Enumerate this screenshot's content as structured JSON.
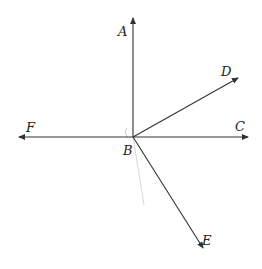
{
  "diagram": {
    "type": "rays-from-point",
    "vertex": {
      "label": "B",
      "x": 133,
      "y": 137
    },
    "rays": [
      {
        "label": "A",
        "tip": [
          133,
          16
        ]
      },
      {
        "label": "C",
        "tip": [
          250,
          137
        ]
      },
      {
        "label": "D",
        "tip": [
          240,
          77
        ]
      },
      {
        "label": "E",
        "tip": [
          204,
          250
        ]
      },
      {
        "label": "F",
        "tip": [
          17,
          137
        ]
      }
    ],
    "labels": {
      "A": "A",
      "B": "B",
      "C": "C",
      "D": "D",
      "E": "E",
      "F": "F"
    },
    "colors": {
      "line": "#333333",
      "faint": "#c8c8c8"
    }
  }
}
